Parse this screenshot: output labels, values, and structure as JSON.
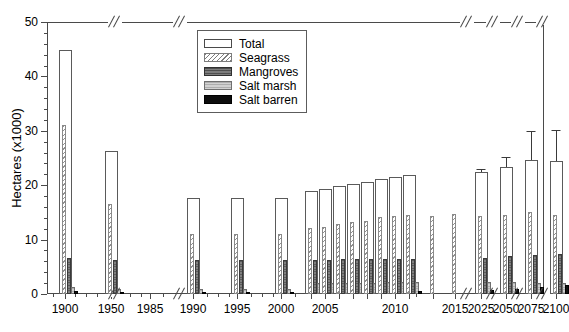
{
  "chart_data": {
    "type": "bar",
    "title": "",
    "xlabel": "",
    "ylabel": "Hectares (x1000)",
    "ylim": [
      0,
      50
    ],
    "ytick_step": 10,
    "yminor_step": 2,
    "grid": false,
    "legend_position": "top-center",
    "axis_breaks": true,
    "ytick_labels": [
      "0",
      "10",
      "20",
      "30",
      "40",
      "50"
    ],
    "xtick_labels": [
      "1900",
      "1950",
      "1985",
      "1990",
      "1995",
      "2000",
      "2005",
      "2010",
      "2015",
      "2025",
      "2050",
      "2075",
      "2100"
    ],
    "legend": [
      {
        "name": "Total",
        "style": "outline-white"
      },
      {
        "name": "Seagrass",
        "style": "diagonal-hatch"
      },
      {
        "name": "Mangroves",
        "style": "dark-gray"
      },
      {
        "name": "Salt marsh",
        "style": "light-gray"
      },
      {
        "name": "Salt barren",
        "style": "black"
      }
    ],
    "series": [
      {
        "name": "Total",
        "values": [
          44.8,
          26.3,
          null,
          17.6,
          17.6,
          17.7,
          18.9,
          19.3,
          19.8,
          20.2,
          20.6,
          21.2,
          21.6,
          21.8,
          null,
          null,
          22.5,
          23.4,
          24.6,
          24.5
        ]
      },
      {
        "name": "Seagrass",
        "values": [
          31.0,
          16.5,
          null,
          11.0,
          11.0,
          11.1,
          12.1,
          12.4,
          12.8,
          13.2,
          13.5,
          14.1,
          14.4,
          14.6,
          14.3,
          14.8,
          14.3,
          14.5,
          15.0,
          14.6
        ]
      },
      {
        "name": "Mangroves",
        "values": [
          6.6,
          6.3,
          null,
          6.3,
          6.3,
          6.3,
          6.3,
          6.3,
          6.4,
          6.4,
          6.4,
          6.5,
          6.5,
          6.5,
          null,
          null,
          6.6,
          6.9,
          7.1,
          7.4
        ]
      },
      {
        "name": "Salt marsh",
        "values": [
          1.2,
          1.0,
          null,
          0.9,
          0.9,
          0.9,
          2.0,
          2.1,
          2.1,
          2.1,
          2.1,
          2.2,
          2.2,
          2.2,
          null,
          null,
          2.3,
          2.2,
          2.1,
          2.0
        ]
      },
      {
        "name": "Salt barren",
        "values": [
          0.5,
          0.4,
          null,
          0.4,
          0.4,
          0.4,
          0.5,
          0.5,
          0.5,
          0.5,
          0.5,
          0.5,
          0.5,
          0.5,
          null,
          null,
          0.7,
          0.9,
          1.2,
          1.6
        ]
      }
    ],
    "groups": [
      {
        "id": "g1900",
        "label": "1900",
        "x_px": 18,
        "total": 44.8,
        "seagrass": 31.0,
        "mangroves": 6.6,
        "salt_marsh": 1.2,
        "salt_barren": 0.5,
        "err": null
      },
      {
        "id": "g1950",
        "label": "1950",
        "x_px": 64,
        "total": 26.3,
        "seagrass": 16.5,
        "mangroves": 6.3,
        "salt_marsh": 1.0,
        "salt_barren": 0.4,
        "err": null
      },
      {
        "id": "g1985",
        "label": "1985",
        "x_px": 103,
        "total": null,
        "seagrass": null,
        "mangroves": null,
        "salt_marsh": null,
        "salt_barren": null,
        "err": null
      },
      {
        "id": "g1990",
        "label": "1990",
        "x_px": 146,
        "total": 17.6,
        "seagrass": 11.0,
        "mangroves": 6.3,
        "salt_marsh": 0.9,
        "salt_barren": 0.4,
        "err": null
      },
      {
        "id": "g1995",
        "label": "1995",
        "x_px": 190,
        "total": 17.6,
        "seagrass": 11.0,
        "mangroves": 6.3,
        "salt_marsh": 0.9,
        "salt_barren": 0.4,
        "err": null
      },
      {
        "id": "g2000",
        "label": "2000",
        "x_px": 234,
        "total": 17.7,
        "seagrass": 11.1,
        "mangroves": 6.3,
        "salt_marsh": 0.9,
        "salt_barren": 0.4,
        "err": null
      },
      {
        "id": "g2004",
        "label": "",
        "x_px": 264,
        "total": 18.9,
        "seagrass": 12.1,
        "mangroves": 6.3,
        "salt_marsh": 2.0,
        "salt_barren": 0.5,
        "err": null
      },
      {
        "id": "g2005",
        "label": "2005",
        "x_px": 278,
        "total": 19.3,
        "seagrass": 12.4,
        "mangroves": 6.3,
        "salt_marsh": 2.1,
        "salt_barren": 0.5,
        "err": null
      },
      {
        "id": "g2006",
        "label": "",
        "x_px": 292,
        "total": 19.8,
        "seagrass": 12.8,
        "mangroves": 6.4,
        "salt_marsh": 2.1,
        "salt_barren": 0.5,
        "err": null
      },
      {
        "id": "g2007",
        "label": "",
        "x_px": 306,
        "total": 20.2,
        "seagrass": 13.2,
        "mangroves": 6.4,
        "salt_marsh": 2.1,
        "salt_barren": 0.5,
        "err": null
      },
      {
        "id": "g2008",
        "label": "",
        "x_px": 320,
        "total": 20.6,
        "seagrass": 13.5,
        "mangroves": 6.4,
        "salt_marsh": 2.1,
        "salt_barren": 0.5,
        "err": null
      },
      {
        "id": "g2009",
        "label": "",
        "x_px": 334,
        "total": 21.2,
        "seagrass": 14.1,
        "mangroves": 6.5,
        "salt_marsh": 2.2,
        "salt_barren": 0.5,
        "err": null
      },
      {
        "id": "g2010",
        "label": "2010",
        "x_px": 348,
        "total": 21.6,
        "seagrass": 14.4,
        "mangroves": 6.5,
        "salt_marsh": 2.2,
        "salt_barren": 0.5,
        "err": null
      },
      {
        "id": "g2011",
        "label": "",
        "x_px": 362,
        "total": 21.8,
        "seagrass": 14.6,
        "mangroves": 6.5,
        "salt_marsh": 2.2,
        "salt_barren": 0.5,
        "err": null
      },
      {
        "id": "g2013",
        "label": "",
        "x_px": 386,
        "total": null,
        "seagrass": 14.3,
        "mangroves": null,
        "salt_marsh": null,
        "salt_barren": null,
        "err": null
      },
      {
        "id": "g2015",
        "label": "2015",
        "x_px": 408,
        "total": null,
        "seagrass": 14.8,
        "mangroves": null,
        "salt_marsh": null,
        "salt_barren": null,
        "err": null
      },
      {
        "id": "g2025",
        "label": "2025",
        "x_px": 434,
        "total": 22.5,
        "seagrass": 14.3,
        "mangroves": 6.6,
        "salt_marsh": 2.3,
        "salt_barren": 0.7,
        "err": 0.5
      },
      {
        "id": "g2050",
        "label": "2050",
        "x_px": 459,
        "total": 23.4,
        "seagrass": 14.5,
        "mangroves": 6.9,
        "salt_marsh": 2.2,
        "salt_barren": 0.9,
        "err": 1.7
      },
      {
        "id": "g2075",
        "label": "2075",
        "x_px": 484,
        "total": 24.6,
        "seagrass": 15.0,
        "mangroves": 7.1,
        "salt_marsh": 2.1,
        "salt_barren": 1.2,
        "err": 5.4
      },
      {
        "id": "g2100",
        "label": "2100",
        "x_px": 509,
        "total": 24.5,
        "seagrass": 14.6,
        "mangroves": 7.4,
        "salt_marsh": 2.0,
        "salt_barren": 1.6,
        "err": 5.6
      }
    ],
    "break_positions_px": [
      68,
      133,
      420,
      446,
      471,
      496
    ]
  }
}
